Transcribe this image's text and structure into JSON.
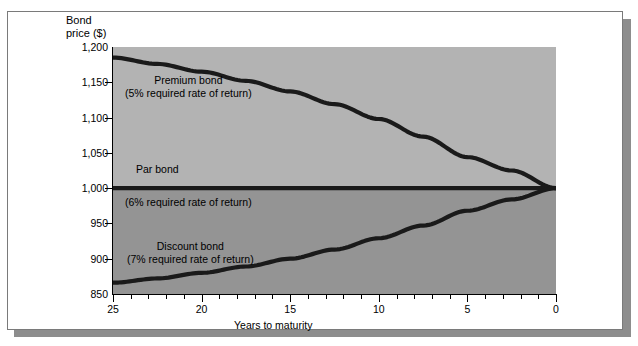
{
  "figure": {
    "background_color": "#ffffff",
    "frame_border_color": "#7a7a7a",
    "shadow_color": "#8d8d8d"
  },
  "chart_data": {
    "type": "line",
    "title": "",
    "ylabel": "Bond\nprice ($)",
    "xlabel": "Years to maturity",
    "xlim": [
      25,
      0
    ],
    "ylim": [
      850,
      1200
    ],
    "x_ticks": [
      25,
      20,
      15,
      10,
      5,
      0
    ],
    "x_tick_labels": [
      "25",
      "20",
      "15",
      "10",
      "5",
      "0"
    ],
    "y_ticks": [
      850,
      900,
      950,
      1000,
      1050,
      1100,
      1150,
      1200
    ],
    "y_tick_labels": [
      "850",
      "900",
      "950",
      "1,000",
      "1,050",
      "1,100",
      "1,150",
      "1,200"
    ],
    "grid": false,
    "legend_position": "inline-annotations",
    "x_axis_direction": "reversed",
    "plot_band_upper_color": "#b3b3b3",
    "plot_band_lower_color": "#949494",
    "band_split_value": 1000,
    "line_color": "#1a1a1a",
    "series": [
      {
        "name": "Premium bond",
        "annotation_line1": "Premium bond",
        "annotation_line2": "(5% required rate of return)",
        "required_rate_of_return": "5%",
        "x": [
          25,
          22.5,
          20,
          17.5,
          15,
          12.5,
          10,
          7.5,
          5,
          2.5,
          0
        ],
        "values": [
          1185,
          1176,
          1165,
          1152,
          1137,
          1119,
          1098,
          1073,
          1044,
          1025,
          1000
        ]
      },
      {
        "name": "Par bond",
        "annotation_line1": "Par bond",
        "annotation_line2": "(6% required rate of return)",
        "required_rate_of_return": "6%",
        "x": [
          25,
          20,
          15,
          10,
          5,
          0
        ],
        "values": [
          1000,
          1000,
          1000,
          1000,
          1000,
          1000
        ]
      },
      {
        "name": "Discount bond",
        "annotation_line1": "Discount bond",
        "annotation_line2": "(7% required rate of return)",
        "required_rate_of_return": "7%",
        "x": [
          25,
          22.5,
          20,
          17.5,
          15,
          12.5,
          10,
          7.5,
          5,
          2.5,
          0
        ],
        "values": [
          866,
          872,
          880,
          889,
          900,
          913,
          929,
          947,
          968,
          984,
          1000
        ]
      }
    ]
  }
}
